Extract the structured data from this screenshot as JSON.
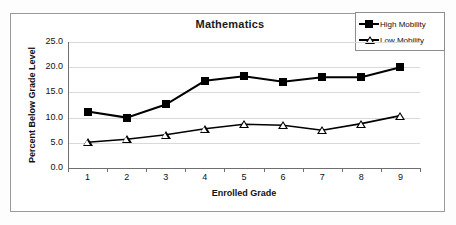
{
  "chart_data": {
    "type": "line",
    "title": "Mathematics",
    "xlabel": "Enrolled Grade",
    "ylabel": "Percent Below Grade Level",
    "categories": [
      "1",
      "2",
      "3",
      "4",
      "5",
      "6",
      "7",
      "8",
      "9"
    ],
    "x": [
      1,
      2,
      3,
      4,
      5,
      6,
      7,
      8,
      9
    ],
    "ylim": [
      0.0,
      25.0
    ],
    "ytick_labels": [
      "25.0",
      "20.0",
      "15.0",
      "10.0",
      "5.0",
      "0.0"
    ],
    "ytick_values": [
      25.0,
      20.0,
      15.0,
      10.0,
      5.0,
      0.0
    ],
    "grid": "horizontal",
    "legend_position": "top-right",
    "series": [
      {
        "name": "High Mobility",
        "marker": "filled-square",
        "color": "#000000",
        "values": [
          11.2,
          10.0,
          12.6,
          17.3,
          18.2,
          17.1,
          18.0,
          18.0,
          20.0
        ]
      },
      {
        "name": "Low Mobility",
        "marker": "open-triangle",
        "color": "#000000",
        "values": [
          5.1,
          5.7,
          6.6,
          7.8,
          8.7,
          8.5,
          7.5,
          8.8,
          10.4
        ]
      }
    ]
  }
}
